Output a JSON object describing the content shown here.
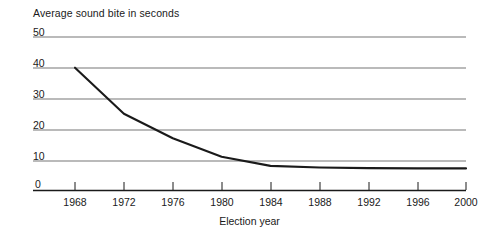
{
  "chart_data": {
    "type": "line",
    "title": "Average sound bite in seconds",
    "subtitle": "",
    "xlabel": "Election year",
    "ylabel": "",
    "x": [
      1968,
      1972,
      1976,
      1980,
      1984,
      1988,
      1992,
      1996,
      2000
    ],
    "values": [
      40,
      25,
      17,
      11,
      8,
      7.5,
      7.3,
      7.2,
      7.2
    ],
    "series": [
      {
        "name": "Average sound bite in seconds",
        "values": [
          40,
          25,
          17,
          11,
          8,
          7.5,
          7.3,
          7.2,
          7.2
        ]
      }
    ],
    "xtick_labels": [
      "1968",
      "1972",
      "1976",
      "1980",
      "1984",
      "1988",
      "1992",
      "1996",
      "2000"
    ],
    "ytick_labels": [
      "0",
      "10",
      "20",
      "30",
      "40",
      "50"
    ],
    "yticks": [
      0,
      10,
      20,
      30,
      40,
      50
    ],
    "xlim": [
      1966,
      2001
    ],
    "ylim": [
      0,
      50
    ],
    "grid": "horizontal",
    "legend": "none",
    "line_color": "#1a1a1a",
    "grid_color": "#808080",
    "axis_color": "#1a1a1a",
    "background": "#ffffff"
  },
  "axis": {
    "title": "Average sound bite in seconds",
    "xlabel": "Election year"
  }
}
